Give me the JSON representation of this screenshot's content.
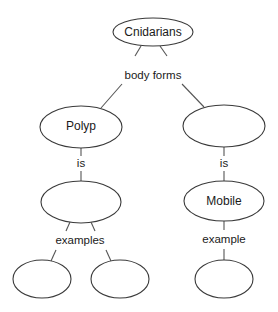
{
  "diagram": {
    "type": "concept-map",
    "colors": {
      "background": "#ffffff",
      "stroke": "#3a3a3a",
      "text": "#1a1a1a"
    },
    "nodes": [
      {
        "id": "cnidarians",
        "label": "Cnidarians"
      },
      {
        "id": "polyp",
        "label": "Polyp"
      },
      {
        "id": "right-form",
        "label": ""
      },
      {
        "id": "polyp-is",
        "label": ""
      },
      {
        "id": "mobile",
        "label": "Mobile"
      },
      {
        "id": "polyp-example-1",
        "label": ""
      },
      {
        "id": "polyp-example-2",
        "label": ""
      },
      {
        "id": "mobile-example",
        "label": ""
      }
    ],
    "links": [
      {
        "id": "body-forms",
        "label": "body forms",
        "from": "cnidarians",
        "to": [
          "polyp",
          "right-form"
        ]
      },
      {
        "id": "polyp-is-link",
        "label": "is",
        "from": "polyp",
        "to": [
          "polyp-is"
        ]
      },
      {
        "id": "right-is-link",
        "label": "is",
        "from": "right-form",
        "to": [
          "mobile"
        ]
      },
      {
        "id": "examples-link",
        "label": "examples",
        "from": "polyp-is",
        "to": [
          "polyp-example-1",
          "polyp-example-2"
        ]
      },
      {
        "id": "example-link",
        "label": "example",
        "from": "mobile",
        "to": [
          "mobile-example"
        ]
      }
    ]
  }
}
